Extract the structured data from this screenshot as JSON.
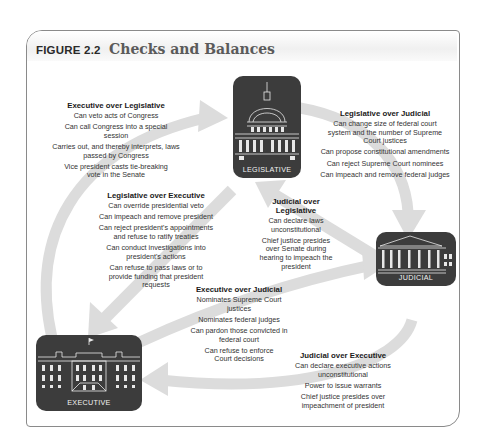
{
  "figure": {
    "label": "FIGURE 2.2",
    "title": "Checks and Balances"
  },
  "branches": {
    "legislative": {
      "label": "LEGISLATIVE",
      "icon": "capitol-building-icon"
    },
    "executive": {
      "label": "EXECUTIVE",
      "icon": "white-house-icon"
    },
    "judicial": {
      "label": "JUDICIAL",
      "icon": "supreme-court-building-icon"
    }
  },
  "checks": {
    "executive_over_legislative": {
      "heading": "Executive over Legislative",
      "items": [
        "Can veto acts of Congress",
        "Can call Congress into a special session",
        "Carries out, and thereby interprets, laws passed by Congress",
        "Vice president casts tie-breaking vote in the Senate"
      ]
    },
    "legislative_over_judicial": {
      "heading": "Legislative over Judicial",
      "items": [
        "Can change size of federal court system and the number of Supreme Court justices",
        "Can propose constitutional amendments",
        "Can reject Supreme Court nominees",
        "Can impeach and remove federal judges"
      ]
    },
    "legislative_over_executive": {
      "heading": "Legislative over Executive",
      "items": [
        "Can override presidential veto",
        "Can impeach and remove president",
        "Can reject president's appointments and refuse to ratify treaties",
        "Can conduct investigations into president's actions",
        "Can refuse to pass laws or to provide funding that president requests"
      ]
    },
    "judicial_over_legislative": {
      "heading": "Judicial over Legislative",
      "items": [
        "Can declare laws unconstitutional",
        "Chief justice presides over Senate during hearing to impeach the president"
      ]
    },
    "executive_over_judicial": {
      "heading": "Executive over Judicial",
      "items": [
        "Nominates Supreme Court justices",
        "Nominates federal judges",
        "Can pardon those convicted in federal court",
        "Can refuse to enforce Court decisions"
      ]
    },
    "judicial_over_executive": {
      "heading": "Judicial over Executive",
      "items": [
        "Can declare executive actions unconstitutional",
        "Power to issue warrants",
        "Chief justice presides over impeachment of president"
      ]
    }
  },
  "colors": {
    "arrow": "#d9d9d9",
    "building": "#3c3c3c",
    "frame": "#8a8a8a",
    "heading_text": "#1a1a1a",
    "body_text": "#333333"
  }
}
